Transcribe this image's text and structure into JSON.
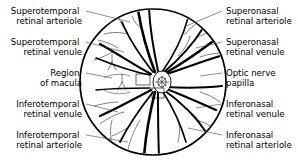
{
  "figure": {
    "view_shape": "circle",
    "ink_color": "#000000",
    "background_color": "#ffffff",
    "leader_color": "#444444"
  },
  "labels": {
    "left": [
      {
        "id": "superotemporal-retinal-arteriole",
        "line1": "Superotemporal",
        "line2": "retinal arteriole",
        "text_x": 82,
        "text_y": 14,
        "leader": "M 86 11 L 130 22"
      },
      {
        "id": "superotemporal-retinal-venule",
        "line1": "Superotemporal",
        "line2": "retinal venule",
        "text_x": 82,
        "text_y": 45,
        "leader": "M 86 42 L 124 52"
      },
      {
        "id": "region-of-macula",
        "line1": "Region",
        "line2": "of macula",
        "text_x": 82,
        "text_y": 76,
        "leader": "M 86 73 L 112 78"
      },
      {
        "id": "inferotemporal-retinal-venule",
        "line1": "Inferotemporal",
        "line2": "retinal venule",
        "text_x": 82,
        "text_y": 107,
        "leader": "M 86 104 L 118 112"
      },
      {
        "id": "inferotemporal-retinal-arteriole",
        "line1": "Inferotemporal",
        "line2": "retinal arteriole",
        "text_x": 82,
        "text_y": 138,
        "leader": "M 86 135 L 128 142"
      }
    ],
    "right": [
      {
        "id": "superonasal-retinal-arteriole",
        "line1": "Superonasal",
        "line2": "retinal arteriole",
        "text_x": 226,
        "text_y": 14,
        "leader": "M 222 11 L 186 26"
      },
      {
        "id": "superonasal-retinal-venule",
        "line1": "Superonasal",
        "line2": "retinal venule",
        "text_x": 226,
        "text_y": 45,
        "leader": "M 222 42 L 196 48"
      },
      {
        "id": "optic-nerve-papilla",
        "line1": "Optic nerve",
        "line2": "papilla",
        "text_x": 226,
        "text_y": 76,
        "leader": "M 222 73 L 200 76"
      },
      {
        "id": "inferonasal-retinal-venule",
        "line1": "Inferonasal",
        "line2": "retinal venule",
        "text_x": 226,
        "text_y": 107,
        "leader": "M 222 104 L 196 108"
      },
      {
        "id": "inferonasal-retinal-arteriole",
        "line1": "Inferonasal",
        "line2": "retinal arteriole",
        "text_x": 226,
        "text_y": 138,
        "leader": "M 222 135 L 188 128"
      }
    ]
  },
  "fundus": {
    "center_x": 153,
    "center_y": 82,
    "radius": 73,
    "optic_disc": {
      "center_x": 162,
      "center_y": 82,
      "rx": 9,
      "ry": 11
    },
    "macula": {
      "center_x": 118,
      "center_y": 84,
      "rx": 13,
      "ry": 9
    }
  }
}
